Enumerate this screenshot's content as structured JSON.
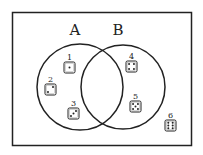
{
  "diagram": {
    "type": "venn",
    "sets": [
      {
        "label": "A",
        "cx": 80,
        "cy": 87,
        "r": 43
      },
      {
        "label": "B",
        "cx": 123,
        "cy": 87,
        "r": 42
      }
    ],
    "items": [
      {
        "label": "1",
        "pips": 1,
        "region": "A only",
        "x": 64,
        "y": 62
      },
      {
        "label": "2",
        "pips": 2,
        "region": "A only",
        "x": 45,
        "y": 84
      },
      {
        "label": "3",
        "pips": 3,
        "region": "A only",
        "x": 68,
        "y": 108
      },
      {
        "label": "4",
        "pips": 4,
        "region": "B only",
        "x": 126,
        "y": 61
      },
      {
        "label": "5",
        "pips": 5,
        "region": "B only",
        "x": 130,
        "y": 101
      },
      {
        "label": "6",
        "pips": 6,
        "region": "outside",
        "x": 165,
        "y": 120
      }
    ],
    "colors": {
      "stroke": "#222222",
      "background": "#ffffff"
    }
  }
}
